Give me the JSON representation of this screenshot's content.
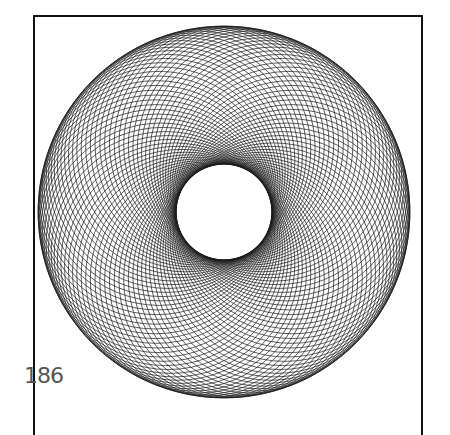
{
  "page": {
    "page_number": "186"
  },
  "figure": {
    "center": [
      224,
      212
    ],
    "outer_radius": 186,
    "inner_radius": 48,
    "circle_count": 90,
    "stroke_color": "#1a1a1a"
  }
}
